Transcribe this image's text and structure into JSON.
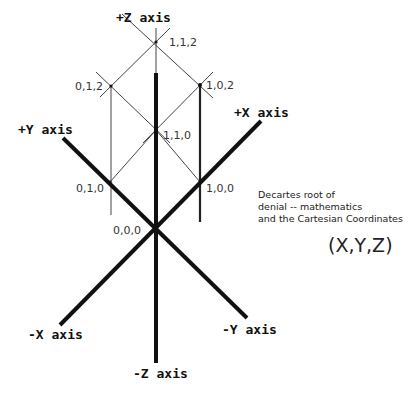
{
  "axes": {
    "pos_z": "+Z axis",
    "neg_z": "-Z axis",
    "pos_x": "+X axis",
    "neg_x": "-X axis",
    "pos_y": "+Y axis",
    "neg_y": "-Y axis"
  },
  "points": {
    "p112": "1,1,2",
    "p012": "0,1,2",
    "p102": "1,0,2",
    "p110": "1,1,0",
    "p010": "0,1,0",
    "p100": "1,0,0",
    "p000": "0,0,0"
  },
  "caption": {
    "line1": "Decartes root of",
    "line2": "denial -- mathematics",
    "line3": "and the Cartesian Coordinates"
  },
  "tuple": "(X,Y,Z)",
  "colors": {
    "axis": "#111111",
    "grid": "#444444",
    "background": "#ffffff"
  }
}
